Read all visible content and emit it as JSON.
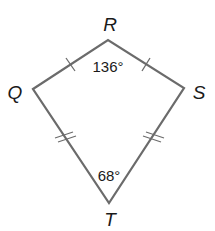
{
  "diagram": {
    "shape": "kite",
    "name": "QRST",
    "colors": {
      "stroke": "#6b6b6b",
      "text": "#1a1a1a",
      "background": "#ffffff"
    },
    "vertices": {
      "Q": {
        "label": "Q",
        "x": 33,
        "y": 89
      },
      "R": {
        "label": "R",
        "x": 108,
        "y": 40
      },
      "S": {
        "label": "S",
        "x": 184,
        "y": 88
      },
      "T": {
        "label": "T",
        "x": 109,
        "y": 203
      }
    },
    "angles": {
      "R": {
        "label": "136°"
      },
      "T": {
        "label": "68°"
      }
    },
    "congruence_marks": {
      "QR": 1,
      "RS": 1,
      "QT": 2,
      "ST": 2
    }
  }
}
